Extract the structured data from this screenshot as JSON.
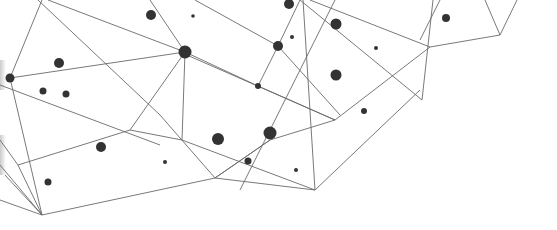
{
  "illustration": {
    "type": "network-polygon-graphic",
    "width": 557,
    "height": 230,
    "background": "#ffffff",
    "line_color": "#6a6a6a",
    "node_color": "#333333",
    "edges": [
      [
        42,
        0,
        10,
        78
      ],
      [
        38,
        0,
        160,
        115
      ],
      [
        10,
        78,
        185,
        52
      ],
      [
        10,
        78,
        42,
        215
      ],
      [
        0,
        85,
        160,
        145
      ],
      [
        185,
        52,
        182,
        140
      ],
      [
        185,
        52,
        130,
        130
      ],
      [
        185,
        52,
        150,
        0
      ],
      [
        185,
        52,
        258,
        86
      ],
      [
        48,
        0,
        185,
        52
      ],
      [
        258,
        86,
        278,
        46
      ],
      [
        278,
        46,
        300,
        0
      ],
      [
        278,
        46,
        195,
        0
      ],
      [
        278,
        46,
        340,
        115
      ],
      [
        258,
        86,
        335,
        120
      ],
      [
        180,
        52,
        335,
        120
      ],
      [
        130,
        130,
        18,
        165
      ],
      [
        130,
        130,
        182,
        140
      ],
      [
        182,
        140,
        315,
        190
      ],
      [
        160,
        115,
        215,
        178
      ],
      [
        215,
        178,
        270,
        140
      ],
      [
        215,
        178,
        42,
        215
      ],
      [
        215,
        178,
        315,
        190
      ],
      [
        270,
        140,
        335,
        120
      ],
      [
        270,
        140,
        215,
        178
      ],
      [
        240,
        190,
        335,
        0
      ],
      [
        303,
        0,
        315,
        190
      ],
      [
        315,
        190,
        420,
        90
      ],
      [
        335,
        120,
        430,
        47
      ],
      [
        310,
        0,
        430,
        47
      ],
      [
        300,
        0,
        422,
        100
      ],
      [
        422,
        100,
        433,
        0
      ],
      [
        430,
        47,
        500,
        35
      ],
      [
        500,
        35,
        485,
        0
      ],
      [
        500,
        35,
        517,
        0
      ],
      [
        420,
        40,
        440,
        0
      ],
      [
        18,
        165,
        42,
        215
      ],
      [
        0,
        165,
        42,
        215
      ],
      [
        0,
        200,
        42,
        215
      ],
      [
        5,
        175,
        42,
        215
      ],
      [
        0,
        140,
        18,
        165
      ]
    ],
    "nodes": [
      {
        "x": 10,
        "y": 78,
        "r": 4.5
      },
      {
        "x": 59,
        "y": 63,
        "r": 5
      },
      {
        "x": 43,
        "y": 91,
        "r": 3.5
      },
      {
        "x": 66,
        "y": 94,
        "r": 3.5
      },
      {
        "x": 151,
        "y": 15,
        "r": 5
      },
      {
        "x": 193,
        "y": 16,
        "r": 1.8
      },
      {
        "x": 185,
        "y": 52,
        "r": 6.5
      },
      {
        "x": 278,
        "y": 46,
        "r": 5
      },
      {
        "x": 292,
        "y": 37,
        "r": 2
      },
      {
        "x": 289,
        "y": 4,
        "r": 5
      },
      {
        "x": 336,
        "y": 24,
        "r": 5.5
      },
      {
        "x": 376,
        "y": 48,
        "r": 2
      },
      {
        "x": 336,
        "y": 75,
        "r": 5.5
      },
      {
        "x": 258,
        "y": 86,
        "r": 3
      },
      {
        "x": 364,
        "y": 111,
        "r": 3
      },
      {
        "x": 446,
        "y": 18,
        "r": 4
      },
      {
        "x": 101,
        "y": 147,
        "r": 5
      },
      {
        "x": 48,
        "y": 182,
        "r": 3.5
      },
      {
        "x": 165,
        "y": 162,
        "r": 2
      },
      {
        "x": 218,
        "y": 139,
        "r": 6
      },
      {
        "x": 270,
        "y": 133,
        "r": 6.5
      },
      {
        "x": 248,
        "y": 161,
        "r": 3.5
      },
      {
        "x": 296,
        "y": 170,
        "r": 2
      }
    ]
  }
}
